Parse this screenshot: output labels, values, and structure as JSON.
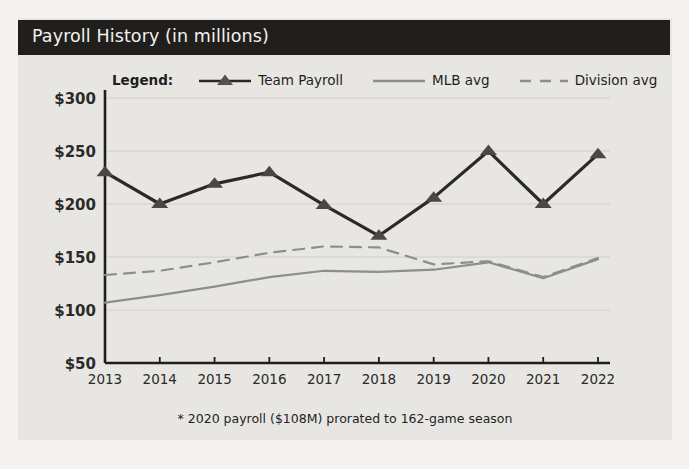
{
  "header": {
    "title": "Payroll History (in millions)",
    "bar_color": "#211f1e",
    "text_color": "#f3f1ee"
  },
  "legend": {
    "title": "Legend:",
    "items": [
      {
        "label": "Team Payroll",
        "style": "solid-with-triangle-marker",
        "color": "#2c2a28"
      },
      {
        "label": "MLB avg",
        "style": "solid",
        "color": "#8d8d89"
      },
      {
        "label": "Division avg",
        "style": "dashed",
        "color": "#8d8d89"
      }
    ]
  },
  "footnote": "* 2020 payroll ($108M) prorated to 162-game season",
  "chart_data": {
    "type": "line",
    "title": "Payroll History (in millions)",
    "xlabel": "",
    "ylabel": "",
    "x": [
      "2013",
      "2014",
      "2015",
      "2016",
      "2017",
      "2018",
      "2019",
      "2020",
      "2021",
      "2022"
    ],
    "categories": [
      "2013",
      "2014",
      "2015",
      "2016",
      "2017",
      "2018",
      "2019",
      "2020",
      "2021",
      "2022"
    ],
    "ylim": [
      50,
      300
    ],
    "ytick_labels": [
      "$300",
      "$250",
      "$200",
      "$150",
      "$100",
      "$50"
    ],
    "ytick_values": [
      300,
      250,
      200,
      150,
      100,
      50
    ],
    "grid": true,
    "legend_position": "top",
    "series": [
      {
        "name": "Team Payroll",
        "color": "#2c2a28",
        "style": "solid",
        "marker": "triangle",
        "values": [
          230,
          200,
          219,
          230,
          199,
          170,
          206,
          250,
          200,
          247
        ]
      },
      {
        "name": "MLB avg",
        "color": "#8d8d89",
        "style": "solid",
        "marker": "none",
        "values": [
          107,
          114,
          122,
          131,
          137,
          136,
          138,
          145,
          130,
          148
        ]
      },
      {
        "name": "Division avg",
        "color": "#8d8d89",
        "style": "dashed",
        "marker": "none",
        "values": [
          133,
          137,
          145,
          154,
          160,
          159,
          143,
          146,
          131,
          149
        ]
      }
    ]
  }
}
